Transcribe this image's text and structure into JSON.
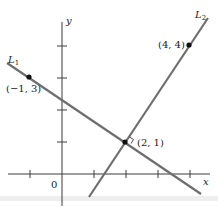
{
  "figure": {
    "type": "coordinate-plane-two-lines",
    "axes": {
      "x_label": "x",
      "y_label": "y",
      "origin_label": "0",
      "x_ticks": [
        -1,
        1,
        2,
        3,
        4
      ],
      "y_ticks": [
        1,
        2,
        3,
        4
      ]
    },
    "lines": [
      {
        "name": "L",
        "subscript": "1",
        "through": [
          [
            -1,
            3
          ],
          [
            2,
            1
          ]
        ]
      },
      {
        "name": "L",
        "subscript": "2",
        "through": [
          [
            2,
            1
          ],
          [
            4,
            4
          ]
        ]
      }
    ],
    "points": [
      {
        "label": "(−1, 3)",
        "x": -1,
        "y": 3
      },
      {
        "label": "(2, 1)",
        "x": 2,
        "y": 1,
        "right_angle_marker": true
      },
      {
        "label": "(4, 4)",
        "x": 4,
        "y": 4
      }
    ],
    "colors": {
      "axis": "#3a3a3a",
      "line": "#6e6e6e",
      "point": "#111111"
    }
  }
}
